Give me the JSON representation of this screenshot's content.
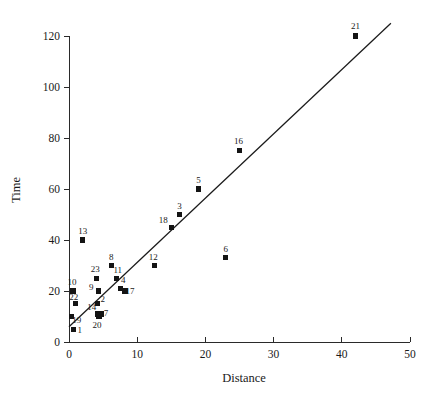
{
  "chart_data": {
    "type": "scatter",
    "title": "",
    "xlabel": "Distance",
    "ylabel": "Time",
    "xlim": [
      0,
      50
    ],
    "ylim": [
      0,
      120
    ],
    "xticks": [
      0,
      10,
      20,
      30,
      40,
      50
    ],
    "yticks": [
      0,
      20,
      40,
      60,
      80,
      100,
      120
    ],
    "xtick_labels": [
      "0",
      "10",
      "20",
      "30",
      "40",
      "50"
    ],
    "ytick_labels": [
      "0",
      "20",
      "40",
      "60",
      "80",
      "100",
      "120"
    ],
    "grid": false,
    "legend": "none",
    "marker_style": "filled-square",
    "marker_color": "#141414",
    "line_color": "#1a1a1a",
    "points": [
      {
        "label": "1",
        "x": 0.7,
        "y": 5,
        "lx": 6,
        "ly": 4
      },
      {
        "label": "2",
        "x": 4.2,
        "y": 15,
        "lx": 5,
        "ly": -2
      },
      {
        "label": "3",
        "x": 16.2,
        "y": 50,
        "lx": 0,
        "ly": -6
      },
      {
        "label": "4",
        "x": 7.5,
        "y": 21,
        "lx": 3,
        "ly": -5
      },
      {
        "label": "5",
        "x": 19.0,
        "y": 60,
        "lx": 0,
        "ly": -6
      },
      {
        "label": "6",
        "x": 23.0,
        "y": 33,
        "lx": 0,
        "ly": -6
      },
      {
        "label": "7",
        "x": 4.7,
        "y": 11,
        "lx": 5,
        "ly": 2
      },
      {
        "label": "8",
        "x": 6.2,
        "y": 30,
        "lx": 0,
        "ly": -6
      },
      {
        "label": "9",
        "x": 4.3,
        "y": 20,
        "lx": -7,
        "ly": -1
      },
      {
        "label": "10",
        "x": 0.6,
        "y": 20,
        "lx": -1,
        "ly": -6
      },
      {
        "label": "11",
        "x": 7.0,
        "y": 25,
        "lx": 1,
        "ly": -5
      },
      {
        "label": "12",
        "x": 12.5,
        "y": 30,
        "lx": -1,
        "ly": -6
      },
      {
        "label": "13",
        "x": 2.0,
        "y": 40,
        "lx": 0,
        "ly": -6
      },
      {
        "label": "14",
        "x": 4.2,
        "y": 11,
        "lx": -6,
        "ly": -4
      },
      {
        "label": "16",
        "x": 25.0,
        "y": 75,
        "lx": -1,
        "ly": -7
      },
      {
        "label": "17",
        "x": 8.2,
        "y": 20,
        "lx": 5,
        "ly": 3
      },
      {
        "label": "18",
        "x": 15.0,
        "y": 45,
        "lx": -8,
        "ly": -4
      },
      {
        "label": "19",
        "x": 0.4,
        "y": 10,
        "lx": 5,
        "ly": 6
      },
      {
        "label": "20",
        "x": 4.4,
        "y": 10,
        "lx": -2,
        "ly": 11
      },
      {
        "label": "21",
        "x": 42.0,
        "y": 120,
        "lx": 0,
        "ly": -7
      },
      {
        "label": "22",
        "x": 1.0,
        "y": 15,
        "lx": -2,
        "ly": -4
      },
      {
        "label": "23",
        "x": 4.0,
        "y": 25,
        "lx": -1,
        "ly": -6
      }
    ],
    "fit_line": {
      "description": "least-squares regression line",
      "x_start": 0.0,
      "y_start": 6.0,
      "x_end": 47.2,
      "y_end": 125.0
    }
  },
  "axis_titles": {
    "x": "Distance",
    "y": "Time"
  }
}
